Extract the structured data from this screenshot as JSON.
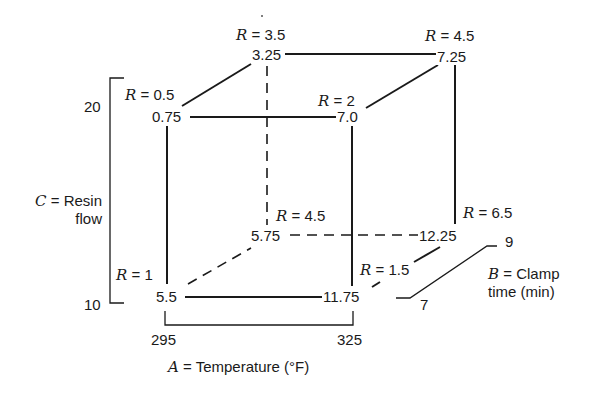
{
  "diagram": {
    "type": "cube-design-plot",
    "vertices": [
      {
        "id": "front-bottom-left",
        "A": 295,
        "B": 7,
        "C": 10,
        "value": "5.5",
        "R": "1"
      },
      {
        "id": "front-bottom-right",
        "A": 325,
        "B": 7,
        "C": 10,
        "value": "11.75",
        "R": "1.5"
      },
      {
        "id": "back-bottom-left",
        "A": 295,
        "B": 9,
        "C": 10,
        "value": "5.75",
        "R": "4.5"
      },
      {
        "id": "back-bottom-right",
        "A": 325,
        "B": 9,
        "C": 10,
        "value": "12.25",
        "R": "6.5"
      },
      {
        "id": "front-top-left",
        "A": 295,
        "B": 7,
        "C": 20,
        "value": "0.75",
        "R": "0.5"
      },
      {
        "id": "front-top-right",
        "A": 325,
        "B": 7,
        "C": 20,
        "value": "7.0",
        "R": "2"
      },
      {
        "id": "back-top-left",
        "A": 295,
        "B": 9,
        "C": 20,
        "value": "3.25",
        "R": "3.5"
      },
      {
        "id": "back-top-right",
        "A": 325,
        "B": 9,
        "C": 20,
        "value": "7.25",
        "R": "4.5"
      }
    ],
    "r_var": "R",
    "r_eq": " = ",
    "axes": {
      "A": {
        "var": "A",
        "label": " = Temperature (°F)",
        "low": "295",
        "high": "325"
      },
      "B": {
        "var": "B",
        "label_line1": " = Clamp",
        "label_line2": "time (min)",
        "low": "7",
        "high": "9"
      },
      "C": {
        "var": "C",
        "label_line1": " = Resin",
        "label_line2": "flow",
        "low": "10",
        "high": "20"
      }
    }
  }
}
